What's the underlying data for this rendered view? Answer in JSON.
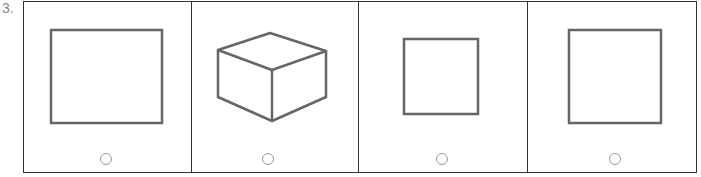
{
  "question": {
    "number": "3."
  },
  "options": [
    {
      "id": "option-1",
      "shape": "rectangle",
      "stroke": "#666666"
    },
    {
      "id": "option-2",
      "shape": "cube",
      "stroke": "#666666"
    },
    {
      "id": "option-3",
      "shape": "small-square",
      "stroke": "#666666"
    },
    {
      "id": "option-4",
      "shape": "square",
      "stroke": "#666666"
    }
  ]
}
